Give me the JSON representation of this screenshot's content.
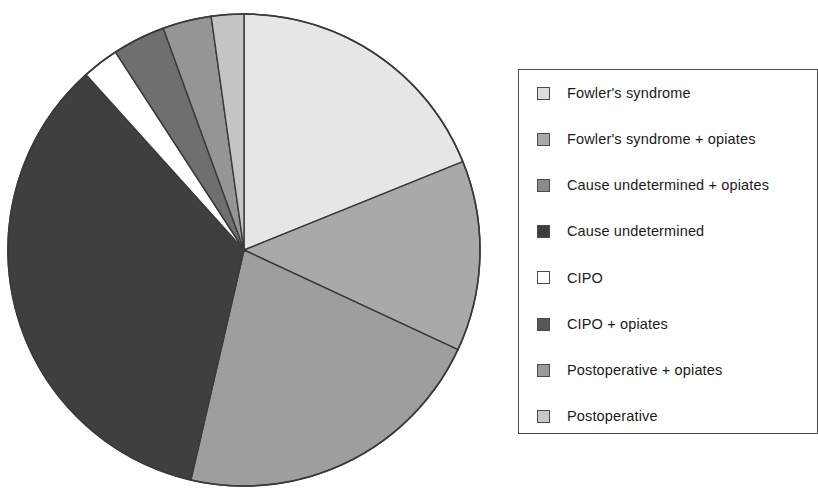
{
  "chart_data": {
    "type": "pie",
    "title": "",
    "subtitle": "",
    "xlabel": "",
    "ylabel": "",
    "grid": false,
    "legend_position": "right",
    "start_angle_deg": 0,
    "direction": "clockwise",
    "categories": [
      "Postoperative",
      "Postoperative + opiates",
      "CIPO + opiates",
      "Cause undetermined",
      "CIPO",
      "Cause undetermined + opiates",
      "Fowler's syndrome + opiates",
      "Fowler's syndrome"
    ],
    "values": [
      18.9,
      13.1,
      21.7,
      34.7,
      2.5,
      3.6,
      3.3,
      2.2
    ],
    "value_unit": "%",
    "slices": [
      {
        "label": "Postoperative",
        "percent": 18.9,
        "start_deg": 0.0,
        "end_deg": 68.0,
        "color": "#e6e6e6"
      },
      {
        "label": "Postoperative + opiates",
        "percent": 13.1,
        "start_deg": 68.0,
        "end_deg": 115.0,
        "color": "#a9a9a9"
      },
      {
        "label": "CIPO + opiates",
        "percent": 21.7,
        "start_deg": 115.0,
        "end_deg": 193.0,
        "color": "#9e9e9e"
      },
      {
        "label": "Cause undetermined",
        "percent": 34.7,
        "start_deg": 193.0,
        "end_deg": 318.0,
        "color": "#3f3f3f"
      },
      {
        "label": "CIPO",
        "percent": 2.5,
        "start_deg": 318.0,
        "end_deg": 327.0,
        "color": "#ffffff"
      },
      {
        "label": "Cause undetermined + opiates",
        "percent": 3.6,
        "start_deg": 327.0,
        "end_deg": 340.0,
        "color": "#6f6f6f"
      },
      {
        "label": "Fowler's syndrome + opiates",
        "percent": 3.3,
        "start_deg": 340.0,
        "end_deg": 352.0,
        "color": "#959595"
      },
      {
        "label": "Fowler's syndrome",
        "percent": 2.2,
        "start_deg": 352.0,
        "end_deg": 360.0,
        "color": "#c4c4c4"
      }
    ]
  },
  "legend": {
    "items": [
      {
        "label": "Fowler's syndrome",
        "color": "#dcdcdc"
      },
      {
        "label": "Fowler's syndrome + opiates",
        "color": "#a8a8a8"
      },
      {
        "label": "Cause undetermined + opiates",
        "color": "#8a8a8a"
      },
      {
        "label": "Cause undetermined",
        "color": "#3d3d3d"
      },
      {
        "label": "CIPO",
        "color": "#ffffff"
      },
      {
        "label": "CIPO + opiates",
        "color": "#575757"
      },
      {
        "label": "Postoperative + opiates",
        "color": "#9a9a9a"
      },
      {
        "label": "Postoperative",
        "color": "#c9c9c9"
      }
    ]
  },
  "geometry": {
    "center_x": 244,
    "center_y": 250,
    "radius": 236,
    "stroke": "#3a3a3a"
  }
}
